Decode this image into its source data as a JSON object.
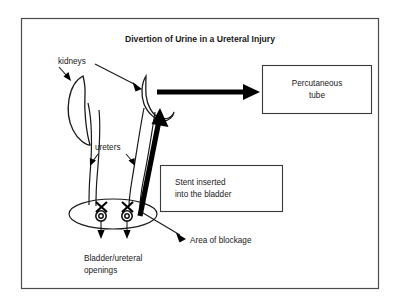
{
  "figure": {
    "title": "Divertion of Urine in a Ureteral Injury",
    "frame": {
      "border_color": "#4c4c4c",
      "background": "#ffffff"
    }
  },
  "labels": {
    "kidneys": "kidneys",
    "ureters": "ureters",
    "area_of_blockage": "Area of blockage",
    "bladder_openings_line1": "Bladder/ureteral",
    "bladder_openings_line2": "openings"
  },
  "boxes": {
    "percutaneous_tube": {
      "line1": "Percutaneous",
      "line2": "tube"
    },
    "stent": {
      "line1": "Stent inserted",
      "line2": "into the bladder"
    }
  },
  "icons": {
    "left_kidney": "kidney-icon",
    "right_kidney": "kidney-icon",
    "bladder": "bladder-icon",
    "left_ureteral_opening": "ureteral-opening-icon",
    "right_ureteral_opening": "ureteral-opening-icon",
    "left_blockage_mark": "blockage-x-icon",
    "right_blockage_mark": "blockage-x-icon",
    "percutaneous_flow_arrow": "thick-right-arrow-icon",
    "stent_arrow": "thick-diagonal-arrow-icon"
  },
  "colors": {
    "ink": "#1a1a1a",
    "accent": "#000000",
    "frame": "#4c4c4c",
    "paper": "#ffffff"
  }
}
